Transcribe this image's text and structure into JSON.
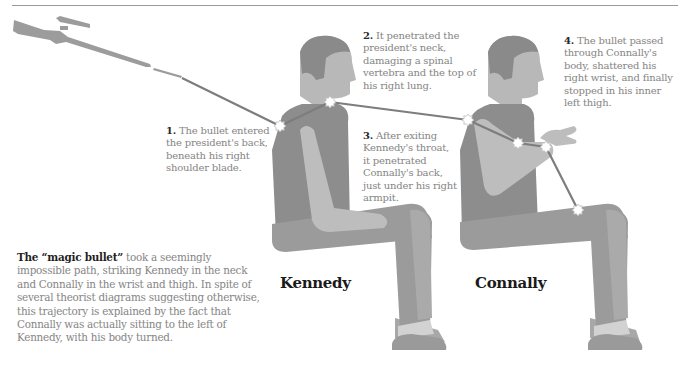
{
  "figure": {
    "colors": {
      "skin": "#b8b8b8",
      "hair": "#8a8a8a",
      "shirt": "#8d8d8d",
      "arm": "#bdbdbd",
      "pants": "#9b9b9b",
      "pants_light": "#aaaaaa",
      "shoe": "#9a9a9a",
      "sock": "#d2d2d2",
      "bullet_path": "#7d7d7d",
      "impact_burst": "#ffffff",
      "rifle": "#9c9c9c"
    },
    "icons": {
      "rifle": "rifle-icon",
      "impact": "impact-burst-icon"
    }
  },
  "annotations": [
    {
      "num": "1.",
      "text": "The bullet entered the president's back, beneath his right shoulder blade."
    },
    {
      "num": "2.",
      "text": "It penetrated the president's neck, damaging a spinal vertebra and the top of his right lung."
    },
    {
      "num": "3.",
      "text": "After exiting Kennedy's throat, it penetrated Connally's back, just under his right armpit."
    },
    {
      "num": "4.",
      "text": "The bullet passed through Connally's body, shattered his right wrist, and finally stopped in his inner left thigh."
    }
  ],
  "labels": {
    "kennedy": "Kennedy",
    "connally": "Connally"
  },
  "summary": {
    "lead": "The “magic bullet”",
    "body": " took a seemingly impossible path, striking Kennedy in the neck and Connally in the wrist and thigh. In spite of several theorist diagrams suggesting otherwise, this trajectory is explained by the fact that Connally was actually sitting to the left of Kennedy, with his body turned."
  }
}
